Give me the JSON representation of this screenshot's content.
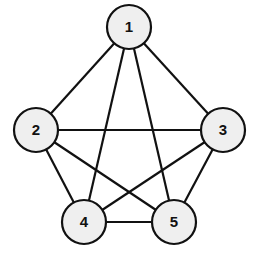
{
  "diagram": {
    "type": "graph",
    "colors": {
      "node_fill": "#efefef",
      "node_stroke": "#111111",
      "edge_stroke": "#111111",
      "label": "#111111",
      "background": "#ffffff"
    },
    "node_radius": 22,
    "nodes": [
      {
        "id": "1",
        "label": "1",
        "x": 129,
        "y": 27
      },
      {
        "id": "2",
        "label": "2",
        "x": 36,
        "y": 130
      },
      {
        "id": "3",
        "label": "3",
        "x": 223,
        "y": 130
      },
      {
        "id": "4",
        "label": "4",
        "x": 84,
        "y": 222
      },
      {
        "id": "5",
        "label": "5",
        "x": 174,
        "y": 222
      }
    ],
    "edges": [
      {
        "from": "1",
        "to": "2"
      },
      {
        "from": "1",
        "to": "3"
      },
      {
        "from": "1",
        "to": "4"
      },
      {
        "from": "1",
        "to": "5"
      },
      {
        "from": "2",
        "to": "3"
      },
      {
        "from": "2",
        "to": "4"
      },
      {
        "from": "2",
        "to": "5"
      },
      {
        "from": "3",
        "to": "4"
      },
      {
        "from": "3",
        "to": "5"
      },
      {
        "from": "4",
        "to": "5"
      }
    ]
  }
}
